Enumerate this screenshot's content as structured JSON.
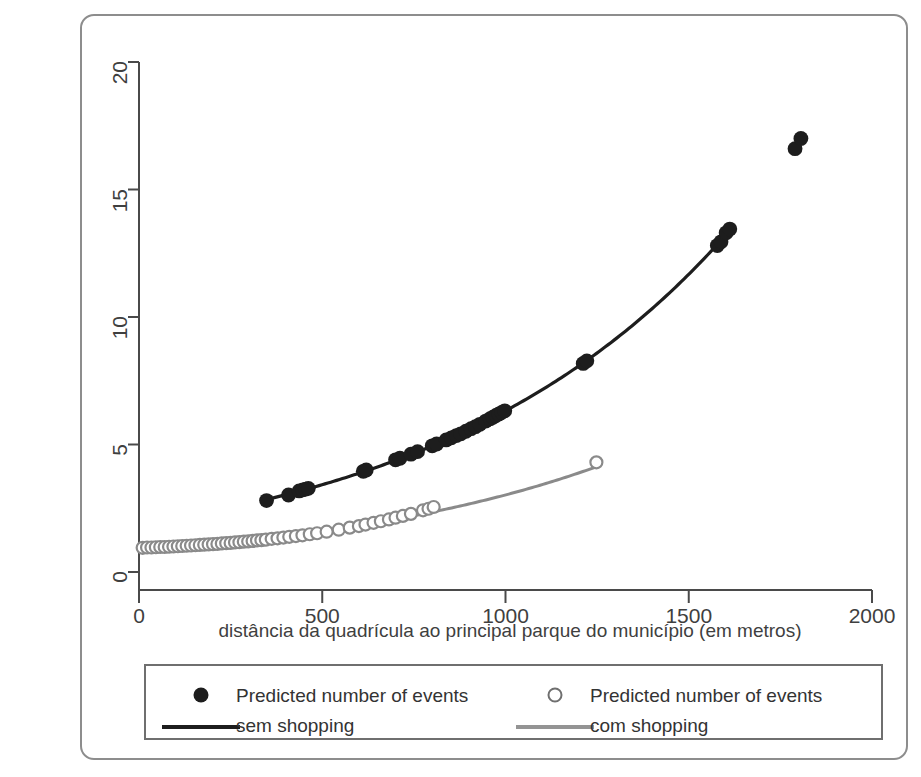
{
  "figure": {
    "background_color": "#ffffff",
    "frame_color": "#8d8d8d",
    "axis_color": "#4a4a4a"
  },
  "axes": {
    "x_title": "distância da quadrícula ao principal parque do município (em metros)",
    "y_title": "",
    "x_ticks": [
      "0",
      "500",
      "1000",
      "1500",
      "2000"
    ],
    "y_ticks": [
      "0",
      "5",
      "10",
      "15",
      "20"
    ]
  },
  "legend": {
    "entries": [
      {
        "marker": "filled-circle",
        "color": "#1d1d1d",
        "line1": "Predicted number of events",
        "line2": "sem shopping"
      },
      {
        "marker": "open-circle",
        "color": "#8a8a8a",
        "line1": "Predicted number of events",
        "line2": "com shopping"
      }
    ]
  },
  "chart_data": {
    "type": "scatter",
    "title": "",
    "subtitle": "",
    "xlabel": "distância da quadrícula ao principal parque do município (em metros)",
    "ylabel": "",
    "xlim": [
      0,
      2000
    ],
    "ylim": [
      0,
      21
    ],
    "x_ticks": [
      0,
      500,
      1000,
      1500,
      2000
    ],
    "y_ticks": [
      0,
      5,
      10,
      15,
      20
    ],
    "grid": false,
    "legend_position": "below-axes",
    "series": [
      {
        "name": "Predicted number of events sem shopping",
        "marker": "filled-circle",
        "color": "#1d1d1d",
        "line_color": "#1d1d1d",
        "points": [
          [
            348,
            2.8
          ],
          [
            408,
            3.02
          ],
          [
            437,
            3.18
          ],
          [
            447,
            3.22
          ],
          [
            455,
            3.25
          ],
          [
            462,
            3.28
          ],
          [
            612,
            3.95
          ],
          [
            620,
            4.0
          ],
          [
            700,
            4.4
          ],
          [
            712,
            4.46
          ],
          [
            742,
            4.62
          ],
          [
            760,
            4.72
          ],
          [
            800,
            4.95
          ],
          [
            812,
            5.02
          ],
          [
            838,
            5.18
          ],
          [
            852,
            5.26
          ],
          [
            866,
            5.35
          ],
          [
            878,
            5.42
          ],
          [
            892,
            5.52
          ],
          [
            906,
            5.62
          ],
          [
            918,
            5.7
          ],
          [
            930,
            5.79
          ],
          [
            946,
            5.92
          ],
          [
            958,
            6.01
          ],
          [
            966,
            6.07
          ],
          [
            974,
            6.14
          ],
          [
            982,
            6.2
          ],
          [
            990,
            6.26
          ],
          [
            998,
            6.32
          ],
          [
            1212,
            8.18
          ],
          [
            1222,
            8.28
          ],
          [
            1578,
            12.8
          ],
          [
            1588,
            12.95
          ],
          [
            1602,
            13.3
          ],
          [
            1612,
            13.45
          ],
          [
            1790,
            16.6
          ],
          [
            1806,
            17.0
          ]
        ],
        "curve": {
          "x_start": 340,
          "x_end": 1615,
          "description": "smooth exponential fit through filled points"
        }
      },
      {
        "name": "Predicted number of events com shopping",
        "marker": "open-circle",
        "color": "#8a8a8a",
        "line_color": "#8a8a8a",
        "points": [
          [
            10,
            0.95
          ],
          [
            22,
            0.96
          ],
          [
            34,
            0.96
          ],
          [
            46,
            0.97
          ],
          [
            58,
            0.98
          ],
          [
            70,
            0.98
          ],
          [
            82,
            0.99
          ],
          [
            94,
            1.0
          ],
          [
            106,
            1.01
          ],
          [
            118,
            1.02
          ],
          [
            130,
            1.03
          ],
          [
            142,
            1.04
          ],
          [
            154,
            1.05
          ],
          [
            166,
            1.06
          ],
          [
            178,
            1.07
          ],
          [
            190,
            1.08
          ],
          [
            202,
            1.09
          ],
          [
            214,
            1.1
          ],
          [
            226,
            1.12
          ],
          [
            238,
            1.13
          ],
          [
            250,
            1.14
          ],
          [
            262,
            1.16
          ],
          [
            274,
            1.17
          ],
          [
            286,
            1.19
          ],
          [
            298,
            1.2
          ],
          [
            310,
            1.22
          ],
          [
            322,
            1.24
          ],
          [
            334,
            1.25
          ],
          [
            346,
            1.27
          ],
          [
            362,
            1.3
          ],
          [
            378,
            1.32
          ],
          [
            394,
            1.35
          ],
          [
            410,
            1.38
          ],
          [
            428,
            1.41
          ],
          [
            446,
            1.44
          ],
          [
            466,
            1.48
          ],
          [
            486,
            1.52
          ],
          [
            512,
            1.58
          ],
          [
            545,
            1.66
          ],
          [
            575,
            1.74
          ],
          [
            600,
            1.8
          ],
          [
            618,
            1.86
          ],
          [
            640,
            1.93
          ],
          [
            660,
            1.99
          ],
          [
            682,
            2.06
          ],
          [
            700,
            2.13
          ],
          [
            720,
            2.2
          ],
          [
            742,
            2.28
          ],
          [
            775,
            2.42
          ],
          [
            790,
            2.48
          ],
          [
            804,
            2.55
          ],
          [
            1248,
            4.3
          ]
        ],
        "curve": {
          "x_start": 5,
          "x_end": 1250,
          "description": "smooth exponential fit through open points"
        }
      }
    ]
  }
}
